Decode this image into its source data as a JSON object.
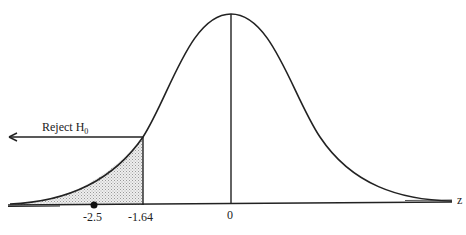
{
  "diagram": {
    "type": "normal-distribution-rejection-region",
    "axis_label": "z",
    "tick_labels": {
      "center": "0",
      "critical": "-1.64",
      "observed": "-2.5"
    },
    "annotation": {
      "text": "Reject H",
      "subscript": "0"
    },
    "shaded_region": "left tail (z < -1.64)",
    "colors": {
      "line": "#222222",
      "shade": "#d8d8d8"
    }
  }
}
